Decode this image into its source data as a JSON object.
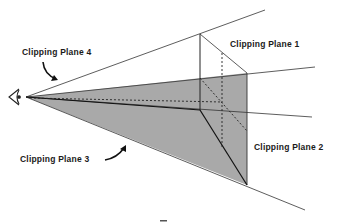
{
  "diagram": {
    "type": "viewing-frustum-clipping",
    "labels": {
      "plane1": "Clipping Plane 1",
      "plane2": "Clipping Plane 2",
      "plane3": "Clipping Plane 3",
      "plane4": "Clipping Plane 4"
    },
    "icons": {
      "eye": "eye-icon",
      "arrow_plane4": "curved-arrow-icon",
      "arrow_plane3": "curved-arrow-icon"
    },
    "colors": {
      "shade": "#a9a9a9",
      "line": "#222222",
      "background": "#ffffff"
    }
  }
}
